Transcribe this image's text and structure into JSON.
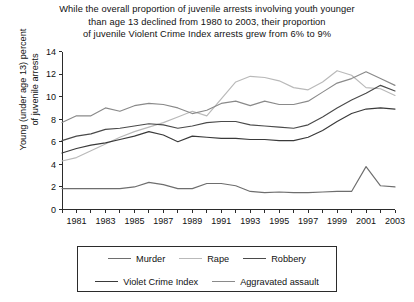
{
  "title": {
    "line1": "While the overall proportion of juvenile arrests involving youth younger",
    "line2": "than age 13 declined from 1980 to 2003, their proportion",
    "line3": "of juvenile Violent Crime Index arrests grew from 6% to 9%"
  },
  "axis": {
    "ylabel_line1": "Young (under age 13) percent",
    "ylabel_line2": "of juvenile arrests"
  },
  "legend": {
    "row1": [
      {
        "label": "Murder",
        "color": "#6e6e6e"
      },
      {
        "label": "Rape",
        "color": "#b9b9b9"
      },
      {
        "label": "Robbery",
        "color": "#4a4a4a"
      }
    ],
    "row2": [
      {
        "label": "Violet Crime Index",
        "color": "#3a3a3a"
      },
      {
        "label": "Aggravated assault",
        "color": "#8a8a8a"
      }
    ]
  },
  "chart_data": {
    "type": "line",
    "title": "While the overall proportion of juvenile arrests involving youth younger than age 13 declined from 1980 to 2003, their proportion of juvenile Violent Crime Index arrests grew from 6% to 9%",
    "xlabel": "",
    "ylabel": "Young (under age 13) percent of juvenile arrests",
    "xlim": [
      1980,
      2003
    ],
    "ylim": [
      0,
      14
    ],
    "yticks": [
      0,
      2,
      4,
      6,
      8,
      10,
      12,
      14
    ],
    "xticks": [
      1980,
      1981,
      1982,
      1983,
      1984,
      1985,
      1986,
      1987,
      1988,
      1989,
      1990,
      1991,
      1992,
      1993,
      1994,
      1995,
      1996,
      1997,
      1998,
      1999,
      2000,
      2001,
      2002,
      2003
    ],
    "xtick_labels": [
      "",
      "1981",
      "",
      "1983",
      "",
      "1985",
      "",
      "1987",
      "",
      "1989",
      "",
      "1991",
      "",
      "1993",
      "",
      "1995",
      "",
      "1997",
      "",
      "1999",
      "",
      "2001",
      "",
      "2003"
    ],
    "grid": false,
    "legend_position": "bottom",
    "x": [
      1980,
      1981,
      1982,
      1983,
      1984,
      1985,
      1986,
      1987,
      1988,
      1989,
      1990,
      1991,
      1992,
      1993,
      1994,
      1995,
      1996,
      1997,
      1998,
      1999,
      2000,
      2001,
      2002,
      2003
    ],
    "series": [
      {
        "name": "Rape",
        "color": "#b9b9b9",
        "values": [
          4.3,
          4.6,
          5.2,
          5.8,
          6.4,
          6.9,
          7.3,
          7.7,
          8.2,
          8.7,
          8.3,
          9.8,
          11.3,
          11.8,
          11.7,
          11.4,
          10.8,
          10.6,
          11.3,
          12.3,
          11.9,
          10.8,
          10.7,
          10.1
        ]
      },
      {
        "name": "Aggravated assault",
        "color": "#8a8a8a",
        "values": [
          7.7,
          8.3,
          8.3,
          9.0,
          8.7,
          9.2,
          9.4,
          9.3,
          9.0,
          8.5,
          8.8,
          9.4,
          9.6,
          9.2,
          9.6,
          9.3,
          9.3,
          9.6,
          10.4,
          11.2,
          11.6,
          12.2,
          11.6,
          11.0
        ]
      },
      {
        "name": "Robbery",
        "color": "#4a4a4a",
        "values": [
          6.1,
          6.5,
          6.7,
          7.1,
          7.2,
          7.4,
          7.6,
          7.5,
          7.2,
          7.4,
          7.7,
          7.8,
          7.8,
          7.5,
          7.4,
          7.3,
          7.2,
          7.5,
          8.2,
          9.0,
          9.7,
          10.3,
          11.0,
          10.5
        ]
      },
      {
        "name": "Violet Crime Index",
        "color": "#3a3a3a",
        "values": [
          5.0,
          5.4,
          5.7,
          5.9,
          6.2,
          6.5,
          6.9,
          6.6,
          6.0,
          6.5,
          6.4,
          6.3,
          6.3,
          6.2,
          6.2,
          6.1,
          6.1,
          6.4,
          7.0,
          7.8,
          8.5,
          8.9,
          9.0,
          8.9
        ]
      },
      {
        "name": "Murder",
        "color": "#6e6e6e",
        "values": [
          1.85,
          1.85,
          1.85,
          1.85,
          1.85,
          2.0,
          2.4,
          2.2,
          1.85,
          1.85,
          2.3,
          2.3,
          2.1,
          1.6,
          1.5,
          1.55,
          1.5,
          1.5,
          1.55,
          1.6,
          1.6,
          3.8,
          2.1,
          2.0
        ]
      }
    ]
  }
}
